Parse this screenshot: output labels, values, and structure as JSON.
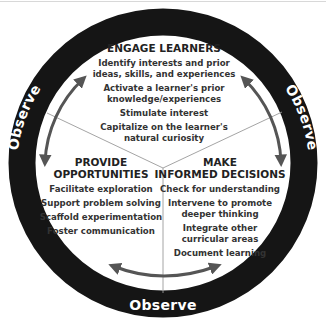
{
  "diagram": {
    "ring_label": "Observe",
    "colors": {
      "ring": "#151515",
      "arrow": "#555555",
      "divider": "#9a9a9a",
      "text": "#222222"
    },
    "sections": {
      "engage": {
        "title": "ENGAGE LEARNERS",
        "items": [
          "Identify interests and prior",
          "ideas, skills, and experiences",
          "Activate a learner's prior",
          "knowledge/experiences",
          "Stimulate interest",
          "Capitalize on the learner's",
          "natural curiosity"
        ]
      },
      "provide": {
        "title_line1": "PROVIDE",
        "title_line2": "OPPORTUNITIES",
        "items": [
          "Facilitate exploration",
          "Support problem solving",
          "Scaffold experimentation",
          "Foster communication"
        ]
      },
      "decide": {
        "title_line1": "MAKE",
        "title_line2": "INFORMED DECISIONS",
        "items": [
          "Check for understanding",
          "Intervene to promote",
          "deeper thinking",
          "Integrate other",
          "curricular areas",
          "Document learning"
        ]
      }
    },
    "observe_labels": {
      "left": "Observe",
      "right": "Observe",
      "bottom": "Observe"
    }
  }
}
